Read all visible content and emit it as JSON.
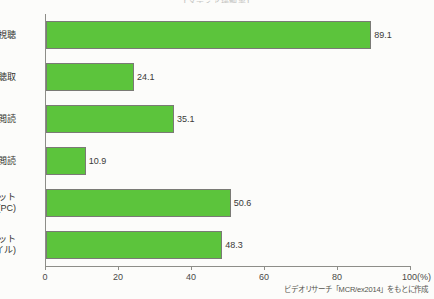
{
  "title": "【メディア接触率】",
  "source_note": "ビデオリサーチ「MCR/ex2014」をもとに作成",
  "chart_data": {
    "type": "bar",
    "orientation": "horizontal",
    "title": "【メディア接触率】",
    "xlabel": "100(%)",
    "ylabel": "",
    "xlim": [
      0,
      100
    ],
    "grid": false,
    "legend": "none",
    "bar_color": "#5cc43c",
    "bar_edge_color": "#7a7a75",
    "axis_color": "#8d8d88",
    "xticks": [
      0,
      20,
      40,
      60,
      80,
      100
    ],
    "xtick_labels": [
      "0",
      "20",
      "40",
      "60",
      "80",
      "100(%)"
    ],
    "categories": [
      "テレビ視聴",
      "ラジオ聴取",
      "新聞閲読",
      "雑誌閲読",
      "ネット\n(PC)",
      "ネット\n(モバイル)"
    ],
    "category_lines": [
      [
        "テレビ視聴"
      ],
      [
        "ラジオ聴取"
      ],
      [
        "新聞閲読"
      ],
      [
        "雑誌閲読"
      ],
      [
        "ネット",
        "(PC)"
      ],
      [
        "ネット",
        "(モバイル)"
      ]
    ],
    "values": [
      89.1,
      24.1,
      35.1,
      10.9,
      50.6,
      48.3
    ],
    "value_labels": [
      "89.1",
      "24.1",
      "35.1",
      "10.9",
      "50.6",
      "48.3"
    ]
  }
}
